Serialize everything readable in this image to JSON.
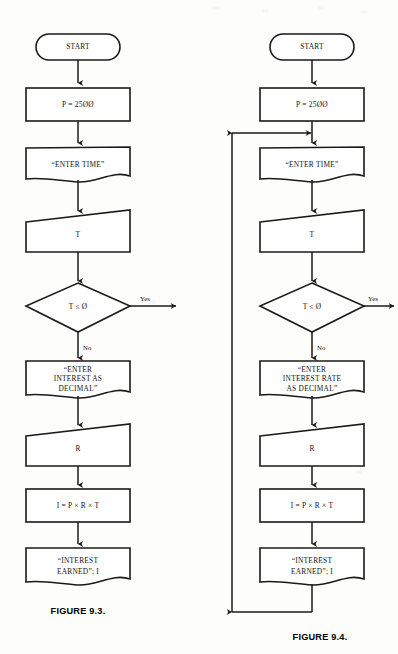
{
  "page": {
    "width": 398,
    "height": 654,
    "background": "#fdfdfc",
    "ink_color": "#1a1a1a"
  },
  "figures": [
    {
      "id": "figure-9-3",
      "caption": "FIGURE 9.3.",
      "has_loop": false,
      "nodes": [
        {
          "id": "start",
          "type": "terminator",
          "text": "START"
        },
        {
          "id": "assign-p",
          "type": "process",
          "text": "P = 25ØØ"
        },
        {
          "id": "prompt-t",
          "type": "document",
          "text": "“ENTER TIME”"
        },
        {
          "id": "input-t",
          "type": "input",
          "text": "T"
        },
        {
          "id": "test-t",
          "type": "decision",
          "text": "T ≤ Ø"
        },
        {
          "id": "prompt-r",
          "type": "document",
          "text": "“ENTER\nINTEREST AS\nDECIMAL”"
        },
        {
          "id": "input-r",
          "type": "input",
          "text": "R"
        },
        {
          "id": "compute-i",
          "type": "process",
          "text": "I = P × R × T"
        },
        {
          "id": "output-i",
          "type": "document",
          "text": "“INTEREST\nEARNED”; I"
        }
      ],
      "branch_labels": {
        "yes": "Yes",
        "no": "No"
      }
    },
    {
      "id": "figure-9-4",
      "caption": "FIGURE 9.4.",
      "has_loop": true,
      "nodes": [
        {
          "id": "start",
          "type": "terminator",
          "text": "START"
        },
        {
          "id": "assign-p",
          "type": "process",
          "text": "P = 25ØØ"
        },
        {
          "id": "prompt-t",
          "type": "document",
          "text": "“ENTER TIME”"
        },
        {
          "id": "input-t",
          "type": "input",
          "text": "T"
        },
        {
          "id": "test-t",
          "type": "decision",
          "text": "T ≤ Ø"
        },
        {
          "id": "prompt-r",
          "type": "document",
          "text": "“ENTER\nINTEREST RATE\nAS DECIMAL”"
        },
        {
          "id": "input-r",
          "type": "input",
          "text": "R"
        },
        {
          "id": "compute-i",
          "type": "process",
          "text": "I = P × R × T"
        },
        {
          "id": "output-i",
          "type": "document",
          "text": "“INTEREST\nEARNED”; I"
        }
      ],
      "branch_labels": {
        "yes": "Yes",
        "no": "No"
      }
    }
  ]
}
